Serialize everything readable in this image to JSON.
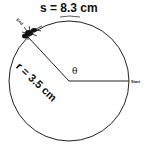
{
  "labels": {
    "arc_length": "s = 8.3 cm",
    "radius": "r = 3.5 cm",
    "angle": "θ",
    "start": "Start",
    "end": "End"
  },
  "colors": {
    "stroke": "#111111",
    "background": "#ffffff"
  }
}
